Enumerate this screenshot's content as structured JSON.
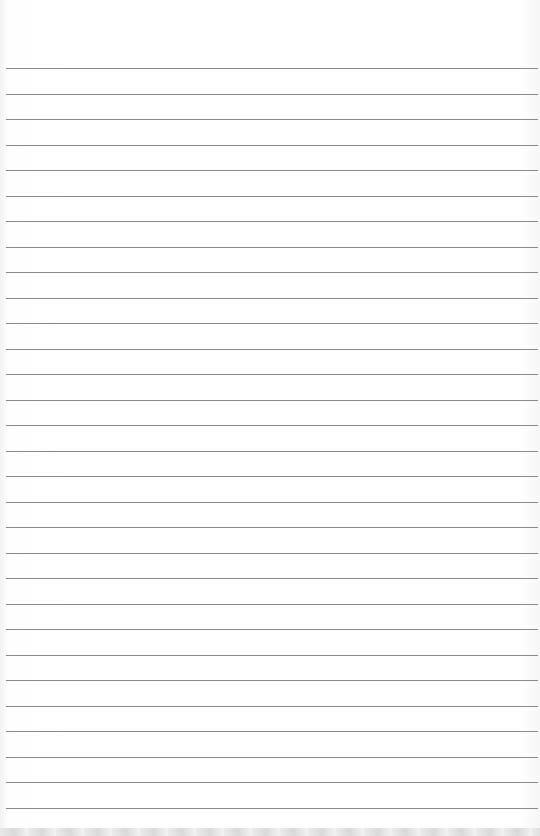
{
  "page": {
    "type": "lined-paper",
    "line_count": 30,
    "first_line_y": 68,
    "line_spacing": 25.5,
    "line_color": "#8a8a8a",
    "background_color": "#ffffff"
  }
}
